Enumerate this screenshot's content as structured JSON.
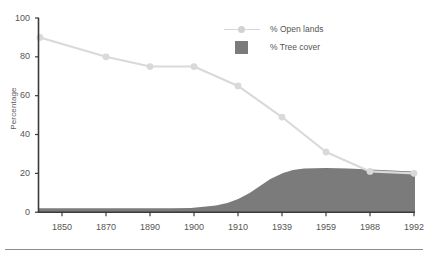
{
  "chart_data": {
    "type": "area",
    "title": "",
    "subtitle": "",
    "xlabel": "",
    "ylabel": "Percentage",
    "ylim": [
      0,
      100
    ],
    "yticks": [
      0,
      20,
      40,
      60,
      80,
      100
    ],
    "grid": false,
    "legend_position": "top-right",
    "categories": [
      "1850",
      "1870",
      "1890",
      "1900",
      "1910",
      "1939",
      "1959",
      "1988",
      "1992"
    ],
    "series": [
      {
        "name": "% Open lands",
        "type": "line",
        "color": "#d9d9d9",
        "marker": "circle",
        "values": [
          90,
          80,
          75,
          75,
          65,
          49,
          31,
          21,
          20
        ]
      },
      {
        "name": "% Tree cover",
        "type": "area",
        "color": "#7b7b7b",
        "values": [
          2,
          2,
          2,
          2,
          5,
          22,
          23,
          22,
          21
        ]
      }
    ]
  },
  "axis": {
    "y_title": "Percentage",
    "y_tick_labels": [
      "100",
      "80",
      "60",
      "40",
      "20",
      "0"
    ],
    "x_tick_labels": [
      "1850",
      "1870",
      "1890",
      "1900",
      "1910",
      "1939",
      "1959",
      "1988",
      "1992"
    ]
  },
  "legend": {
    "items": [
      {
        "label": "% Open lands",
        "swatch": "line-marker",
        "color": "#d9d9d9"
      },
      {
        "label": "% Tree cover",
        "swatch": "filled-square",
        "color": "#7b7b7b"
      }
    ]
  }
}
